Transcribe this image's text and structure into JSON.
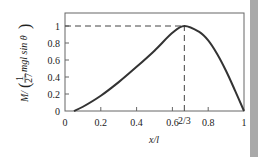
{
  "chart_data": {
    "type": "line",
    "title": "",
    "xlabel": "x/l",
    "ylabel": "M/(1/27 mgl sin θ)",
    "xlim": [
      0,
      1
    ],
    "ylim": [
      0,
      1.15
    ],
    "grid": false,
    "legend": null,
    "x_ticks": [
      "0",
      "0.2",
      "0.4",
      "0.6",
      "2/3",
      "0.8",
      "1"
    ],
    "x_tick_values": [
      0,
      0.2,
      0.4,
      0.6,
      0.6667,
      0.8,
      1
    ],
    "y_ticks": [
      "0",
      "0.2",
      "0.4",
      "0.6",
      "0.8",
      "1"
    ],
    "y_tick_values": [
      0,
      0.2,
      0.4,
      0.6,
      0.8,
      1
    ],
    "annotations": [
      {
        "type": "dashed-hline",
        "y": 1,
        "x_from": 0,
        "x_to": 0.6667
      },
      {
        "type": "dashed-vline",
        "x": 0.6667,
        "y_from": 0,
        "y_to": 1
      },
      {
        "type": "label",
        "text": "2/3",
        "x": 0.6667
      }
    ],
    "series": [
      {
        "name": "M",
        "x": [
          0.05,
          0.1,
          0.2,
          0.3,
          0.4,
          0.5,
          0.6,
          0.6667,
          0.75,
          0.8,
          0.85,
          0.9,
          0.95,
          1.0
        ],
        "y": [
          0.0,
          0.05,
          0.18,
          0.34,
          0.52,
          0.71,
          0.92,
          1.0,
          0.93,
          0.83,
          0.67,
          0.47,
          0.24,
          0.0
        ]
      }
    ]
  },
  "labels": {
    "xlabel": "x/l",
    "ylabel_prefix": "M/",
    "ylabel_frac_num": "1",
    "ylabel_frac_den": "27",
    "ylabel_suffix": "mgl sin θ",
    "two_thirds": "2/3"
  }
}
